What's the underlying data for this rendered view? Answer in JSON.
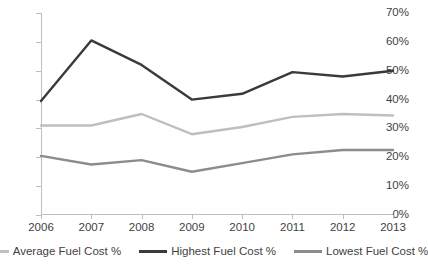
{
  "chart_data": {
    "type": "line",
    "title": "",
    "xlabel": "",
    "ylabel": "",
    "categories": [
      "2006",
      "2007",
      "2008",
      "2009",
      "2010",
      "2011",
      "2012",
      "2013"
    ],
    "x": [
      2006,
      2007,
      2008,
      2009,
      2010,
      2011,
      2012,
      2013
    ],
    "ylim": [
      0,
      70
    ],
    "xlim": [
      2006,
      2013
    ],
    "y_tick_labels": [
      "0%",
      "10%",
      "20%",
      "30%",
      "40%",
      "50%",
      "60%",
      "70%"
    ],
    "y_ticks": [
      0,
      10,
      20,
      30,
      40,
      50,
      60,
      70
    ],
    "grid": false,
    "legend_position": "bottom",
    "series": [
      {
        "name": "Average Fuel Cost %",
        "color": "#bfbfbf",
        "values": [
          31,
          31,
          35,
          28,
          30.5,
          34,
          35,
          34.5
        ]
      },
      {
        "name": "Highest Fuel Cost %",
        "color": "#3a3a3a",
        "values": [
          39.5,
          60.5,
          52,
          40,
          42,
          49.5,
          48,
          50
        ]
      },
      {
        "name": "Lowest Fuel Cost %",
        "color": "#8c8c8c",
        "values": [
          20.5,
          17.5,
          19,
          15,
          18,
          21,
          22.5,
          22.5
        ]
      }
    ]
  },
  "axis": {
    "axis_color": "#bfbfbf"
  }
}
